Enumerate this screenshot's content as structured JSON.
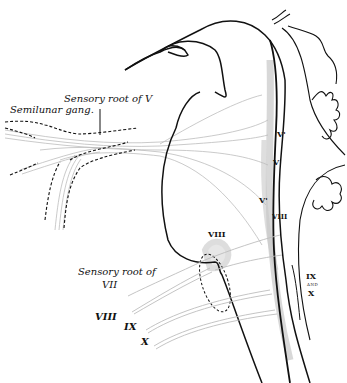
{
  "figure": {
    "labels": {
      "sensory_root_v": "Sensory root of V",
      "semilunar_gang": "Semilunar gang.",
      "v_prime_top": "V'",
      "v_mid": "V",
      "v_prime_low": "V'",
      "viii_right": "VIII",
      "viii_top": "VIII",
      "sensory_root_of": "Sensory root of",
      "vii": "VII",
      "viii_left": "VIII",
      "ix_left": "IX",
      "x_left": "X",
      "ix_right": "IX",
      "and_right": "AND",
      "x_right": "X"
    },
    "colors": {
      "ink": "#111111",
      "fiber": "#bdbdbd",
      "stipple": "#c8c8c8",
      "background": "#ffffff"
    }
  }
}
